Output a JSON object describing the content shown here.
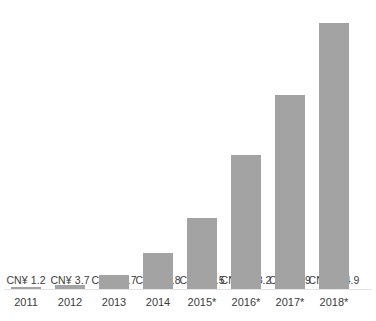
{
  "chart_data": {
    "type": "bar",
    "title": "",
    "xlabel": "",
    "ylabel": "",
    "currency_prefix": "CN¥",
    "grid": false,
    "legend": null,
    "ylim": [
      0,
      244.9
    ],
    "categories": [
      "2011",
      "2012",
      "2013",
      "2014",
      "2015*",
      "2016*",
      "2017*",
      "2018*"
    ],
    "values": [
      1.2,
      3.7,
      12.7,
      32.8,
      65.5,
      123.2,
      179,
      244.9
    ],
    "data_labels": [
      "CN¥ 1.2",
      "CN¥ 3.7",
      "CN¥ 12.7",
      "CN¥ 32.8",
      "CN¥ 65.5",
      "CN¥ 123.2",
      "CN¥ 179",
      "CN¥ 244.9"
    ],
    "bar_color": "#a3a3a3",
    "label_color": "#3b3b3b",
    "background": "#ffffff",
    "annotations": [
      "* denotes forecast/projected years"
    ]
  },
  "bars": [
    {
      "category": "2011",
      "value": 1.2,
      "label": "CN¥ 1.2"
    },
    {
      "category": "2012",
      "value": 3.7,
      "label": "CN¥ 3.7"
    },
    {
      "category": "2013",
      "value": 12.7,
      "label": "CN¥ 12.7"
    },
    {
      "category": "2014",
      "value": 32.8,
      "label": "CN¥ 32.8"
    },
    {
      "category": "2015*",
      "value": 65.5,
      "label": "CN¥ 65.5"
    },
    {
      "category": "2016*",
      "value": 123.2,
      "label": "CN¥ 123.2"
    },
    {
      "category": "2017*",
      "value": 179,
      "label": "CN¥ 179"
    },
    {
      "category": "2018*",
      "value": 244.9,
      "label": "CN¥ 244.9"
    }
  ],
  "footnote": "",
  "layout": {
    "slot_width": 44,
    "bar_width": 30,
    "first_slot_left": 4,
    "baseline_bottom": 32,
    "max_bar_height": 266
  }
}
